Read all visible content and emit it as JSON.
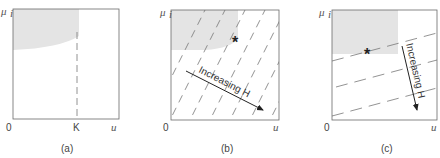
{
  "panels": [
    {
      "caption": "(a)",
      "y_axis_label": "μ",
      "y_axis_sub": "i",
      "x_axis_label": "u",
      "origin_label": "0",
      "x_tick_label": "K",
      "lines": "vertical dashed line at u = K",
      "shaded_region": "upper-left curved region"
    },
    {
      "caption": "(b)",
      "y_axis_label": "μ",
      "y_axis_sub": "i",
      "x_axis_label": "u",
      "origin_label": "0",
      "arrow_label": "Increasing H",
      "marker": "*",
      "lines": "steep positive-slope dashed iso-lines",
      "shaded_region": "upper-left rounded region"
    },
    {
      "caption": "(c)",
      "y_axis_label": "μ",
      "y_axis_sub": "i",
      "x_axis_label": "u",
      "origin_label": "0",
      "arrow_label": "Increasing H",
      "marker": "*",
      "lines": "shallow positive-slope dashed iso-lines",
      "shaded_region": "upper-left rectangular region"
    }
  ],
  "colors": {
    "axis": "#6a6a6a",
    "shade": "#e2e2e2",
    "dash": "#777777",
    "arrow": "#222222"
  }
}
